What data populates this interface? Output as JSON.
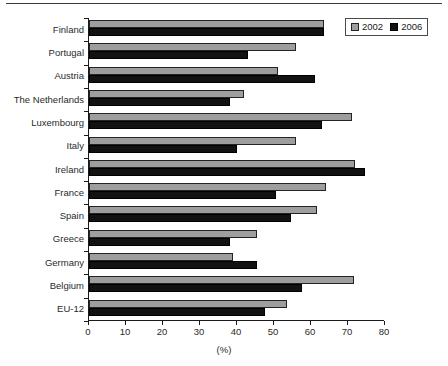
{
  "chart_data": {
    "type": "bar",
    "orientation": "horizontal",
    "title": "",
    "subtitle": "",
    "xlabel": "(%)",
    "ylabel": "",
    "xlim": [
      0,
      80
    ],
    "xticks": [
      0,
      10,
      20,
      30,
      40,
      50,
      60,
      70,
      80
    ],
    "grid": false,
    "legend_position": "top-right",
    "categories": [
      "Finland",
      "Portugal",
      "Austria",
      "The Netherlands",
      "Luxembourg",
      "Italy",
      "Ireland",
      "France",
      "Spain",
      "Greece",
      "Germany",
      "Belgium",
      "EU-12"
    ],
    "series": [
      {
        "name": "2002",
        "color": "#9e9e9e",
        "values": [
          63.5,
          56.0,
          51.0,
          42.0,
          71.0,
          56.0,
          72.0,
          64.0,
          61.5,
          45.5,
          39.0,
          71.5,
          53.5
        ]
      },
      {
        "name": "2006",
        "color": "#121212",
        "values": [
          63.5,
          43.0,
          61.0,
          38.0,
          63.0,
          40.0,
          74.5,
          50.5,
          54.5,
          38.0,
          45.5,
          57.5,
          47.5
        ]
      }
    ]
  },
  "legend": {
    "entries": [
      {
        "label": "2002",
        "swatch": "grey-swatch-icon"
      },
      {
        "label": "2006",
        "swatch": "black-swatch-icon"
      }
    ]
  },
  "axis": {
    "x_title": "(%)",
    "x_tick_labels": [
      "0",
      "10",
      "20",
      "30",
      "40",
      "50",
      "60",
      "70",
      "80"
    ]
  }
}
